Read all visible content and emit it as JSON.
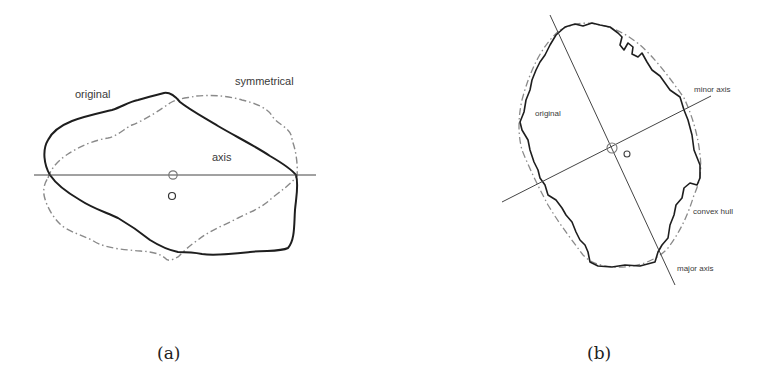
{
  "panels": {
    "a": {
      "caption": "(a)",
      "labels": {
        "original": "original",
        "symmetrical": "symmetrical",
        "axis": "axis"
      }
    },
    "b": {
      "caption": "(b)",
      "labels": {
        "minor_axis": "minor axis",
        "original": "original",
        "convex_hull": "convex hull",
        "major_axis": "major axis"
      }
    }
  },
  "colors": {
    "solid_contour": "#1e1e1e",
    "dashdot_contour": "#8a8a8a",
    "axis_line": "#444444",
    "label_text": "#3a3a3a"
  }
}
